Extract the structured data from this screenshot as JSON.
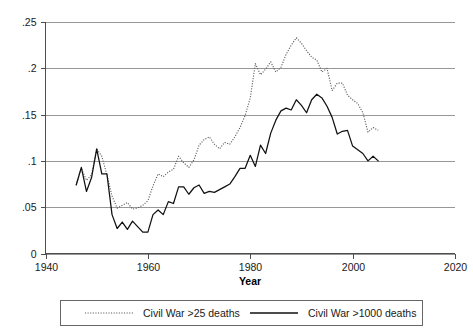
{
  "chart_data": {
    "type": "line",
    "title": "",
    "subtitle": "",
    "xlabel": "Year",
    "ylabel": "",
    "xlim": [
      1940,
      2020
    ],
    "ylim": [
      0,
      0.25
    ],
    "grid": true,
    "grid_axis": "y",
    "legend_position": "bottom",
    "xticks": [
      1940,
      1960,
      1980,
      2000,
      2020
    ],
    "xtick_labels": [
      "1940",
      "1960",
      "1980",
      "2000",
      "2020"
    ],
    "yticks": [
      0,
      0.05,
      0.1,
      0.15,
      0.2,
      0.25
    ],
    "ytick_labels": [
      "0",
      ".05",
      ".1",
      ".15",
      ".2",
      ".25"
    ],
    "x": [
      1946,
      1947,
      1948,
      1949,
      1950,
      1951,
      1952,
      1953,
      1954,
      1955,
      1956,
      1957,
      1958,
      1959,
      1960,
      1961,
      1962,
      1963,
      1964,
      1965,
      1966,
      1967,
      1968,
      1969,
      1970,
      1971,
      1972,
      1973,
      1974,
      1975,
      1976,
      1977,
      1978,
      1979,
      1980,
      1981,
      1982,
      1983,
      1984,
      1985,
      1986,
      1987,
      1988,
      1989,
      1990,
      1991,
      1992,
      1993,
      1994,
      1995,
      1996,
      1997,
      1998,
      1999,
      2000,
      2001,
      2002,
      2003,
      2004,
      2005
    ],
    "series": [
      {
        "name": "Civil War >25 deaths",
        "style": "dotted",
        "color": "#5a5a5a",
        "values": [
          0.074,
          0.092,
          0.079,
          0.085,
          0.113,
          0.105,
          0.085,
          0.062,
          0.049,
          0.052,
          0.055,
          0.048,
          0.049,
          0.052,
          0.057,
          0.073,
          0.086,
          0.083,
          0.088,
          0.091,
          0.105,
          0.098,
          0.093,
          0.101,
          0.117,
          0.123,
          0.126,
          0.118,
          0.113,
          0.12,
          0.118,
          0.126,
          0.136,
          0.149,
          0.168,
          0.205,
          0.193,
          0.199,
          0.207,
          0.196,
          0.201,
          0.215,
          0.225,
          0.233,
          0.227,
          0.219,
          0.212,
          0.209,
          0.196,
          0.2,
          0.176,
          0.184,
          0.184,
          0.171,
          0.166,
          0.162,
          0.152,
          0.131,
          0.136,
          0.133
        ]
      },
      {
        "name": "Civil War >1000 deaths",
        "style": "solid",
        "color": "#111111",
        "values": [
          0.074,
          0.093,
          0.067,
          0.082,
          0.113,
          0.086,
          0.086,
          0.042,
          0.027,
          0.034,
          0.026,
          0.035,
          0.029,
          0.023,
          0.023,
          0.042,
          0.047,
          0.042,
          0.056,
          0.054,
          0.072,
          0.072,
          0.064,
          0.071,
          0.074,
          0.065,
          0.067,
          0.066,
          0.069,
          0.072,
          0.075,
          0.083,
          0.092,
          0.092,
          0.106,
          0.094,
          0.117,
          0.108,
          0.13,
          0.144,
          0.154,
          0.157,
          0.155,
          0.166,
          0.16,
          0.152,
          0.166,
          0.172,
          0.168,
          0.159,
          0.147,
          0.129,
          0.132,
          0.133,
          0.116,
          0.112,
          0.108,
          0.1,
          0.105,
          0.1
        ]
      }
    ],
    "legend_entries": [
      "Civil War >25 deaths",
      "Civil War >1000 deaths"
    ]
  },
  "axes": {
    "x_title": "Year",
    "y_tick_labels": [
      "0",
      ".05",
      ".1",
      ".15",
      ".2",
      ".25"
    ],
    "x_tick_labels": [
      "1940",
      "1960",
      "1980",
      "2000",
      "2020"
    ]
  },
  "legend": {
    "entry_1_label": "Civil War >25 deaths",
    "entry_2_label": "Civil War >1000 deaths"
  },
  "colors": {
    "solid_series": "#111111",
    "dotted_series": "#5a5a5a",
    "gridline": "#8c8c8c",
    "axis": "#4d4d4d",
    "background": "#ffffff"
  }
}
